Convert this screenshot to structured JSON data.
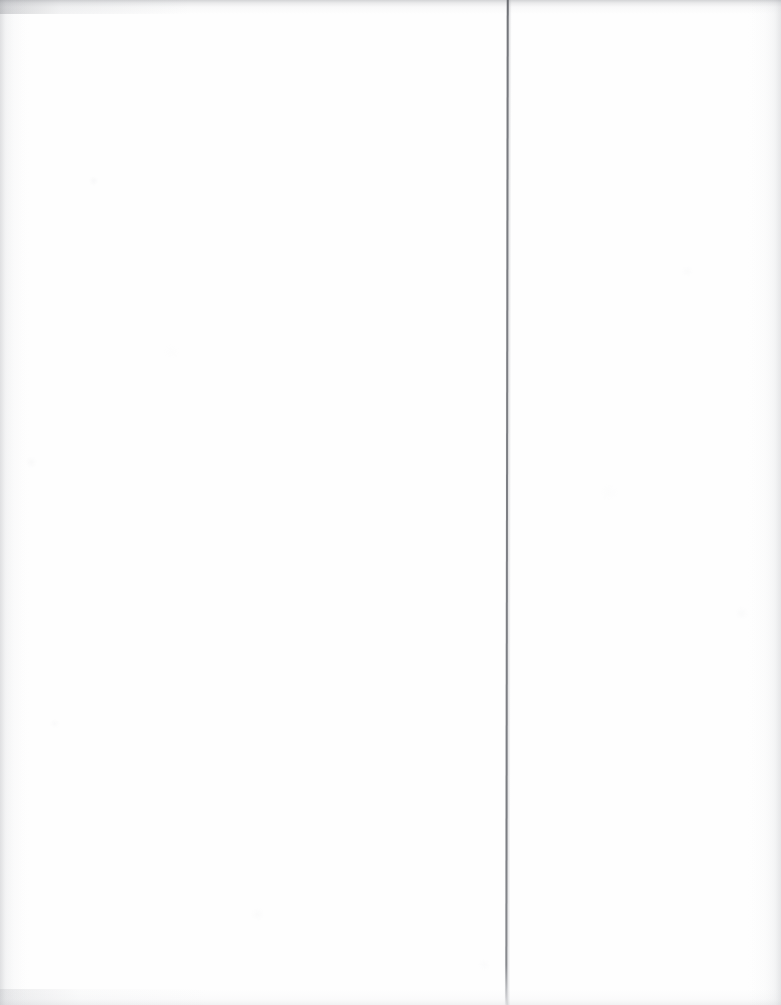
{
  "page": {
    "kind": "scanned-document-page",
    "content_state": "blank",
    "width_px": 781,
    "height_px": 1005,
    "background_color": "#fefefe",
    "visible_text": "",
    "caption": ""
  },
  "marks": {
    "gutter_rule": {
      "name": "vertical-rule",
      "orientation": "vertical",
      "x_px": 507,
      "top_px": 0,
      "bottom_px": 1005,
      "thickness_px": 2,
      "color": "#7a7c81",
      "fades_at_bottom": true
    }
  },
  "scan_artifacts": {
    "top_edge_band": {
      "name": "top-edge-shadow",
      "height_px": 14,
      "color": "#96989d"
    },
    "bottom_edge_band": {
      "name": "bottom-edge-shadow",
      "height_px": 16,
      "color": "#c4c6ca"
    },
    "left_edge_band": {
      "name": "left-edge-shadow",
      "width_px": 30,
      "color": "#b2b4b9"
    },
    "right_edge_band": {
      "name": "right-edge-shadow",
      "width_px": 34,
      "color": "#b7b9be"
    },
    "paper_grain": {
      "name": "paper-grain",
      "color": "#d4d6da"
    }
  }
}
